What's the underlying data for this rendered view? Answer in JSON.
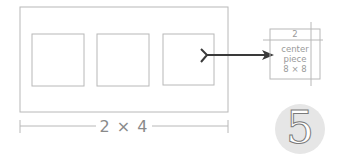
{
  "diagram": {
    "dimension_label": "2 × 4",
    "piece_detail": {
      "top_label": "2",
      "line1": "center",
      "line2": "piece",
      "line3": "8 × 8"
    },
    "step_number": "5",
    "colors": {
      "line": "#b8b8b8",
      "arrow": "#3a3a3a",
      "text": "#8a8a8a",
      "badge": "#e6e6e6"
    }
  }
}
